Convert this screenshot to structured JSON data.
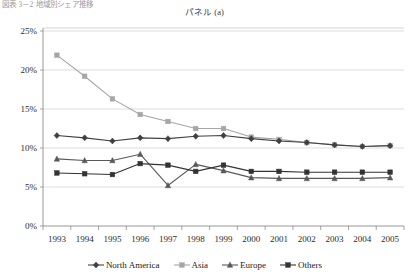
{
  "figure": {
    "caption": "図表 3－2  地域別シェア推移",
    "title": "パネル (a)"
  },
  "legend": {
    "position": "bottom-center",
    "entries": [
      {
        "label": "North America",
        "color": "#404040",
        "marker": "diamond"
      },
      {
        "label": "Asia",
        "color": "#a6a6a6",
        "marker": "square"
      },
      {
        "label": "Europe",
        "color": "#595959",
        "marker": "triangle"
      },
      {
        "label": "Others",
        "color": "#333333",
        "marker": "square"
      }
    ]
  },
  "axes": {
    "y_ticks": [
      "0%",
      "5%",
      "10%",
      "15%",
      "20%",
      "25%"
    ],
    "x_ticks": [
      "1993",
      "1994",
      "1995",
      "1996",
      "1997",
      "1998",
      "1999",
      "2000",
      "2001",
      "2002",
      "2003",
      "2004",
      "2005"
    ]
  },
  "chart_data": {
    "type": "line",
    "title": "パネル (a)",
    "xlabel": "",
    "ylabel": "",
    "ylim": [
      0,
      25
    ],
    "ytick_values": [
      0,
      5,
      10,
      15,
      20,
      25
    ],
    "ytick_format": "percent",
    "grid": "horizontal",
    "legend_position": "bottom-center",
    "categories": [
      "1993",
      "1994",
      "1995",
      "1996",
      "1997",
      "1998",
      "1999",
      "2000",
      "2001",
      "2002",
      "2003",
      "2004",
      "2005"
    ],
    "series": [
      {
        "name": "North America",
        "color": "#404040",
        "marker": "diamond",
        "values": [
          11.6,
          11.3,
          10.9,
          11.3,
          11.2,
          11.5,
          11.6,
          11.2,
          10.9,
          10.7,
          10.4,
          10.2,
          10.3
        ]
      },
      {
        "name": "Asia",
        "color": "#a6a6a6",
        "marker": "square",
        "values": [
          21.9,
          19.2,
          16.3,
          14.3,
          13.4,
          12.5,
          12.5,
          11.4,
          11.1,
          10.7,
          10.4,
          10.2,
          10.3
        ]
      },
      {
        "name": "Europe",
        "color": "#595959",
        "marker": "triangle",
        "values": [
          8.6,
          8.4,
          8.4,
          9.2,
          5.2,
          7.9,
          7.1,
          6.2,
          6.1,
          6.1,
          6.1,
          6.1,
          6.2
        ]
      },
      {
        "name": "Others",
        "color": "#333333",
        "marker": "square",
        "values": [
          6.8,
          6.7,
          6.6,
          8.0,
          7.8,
          7.0,
          7.8,
          7.0,
          7.0,
          6.9,
          6.9,
          6.9,
          6.9
        ]
      }
    ]
  }
}
